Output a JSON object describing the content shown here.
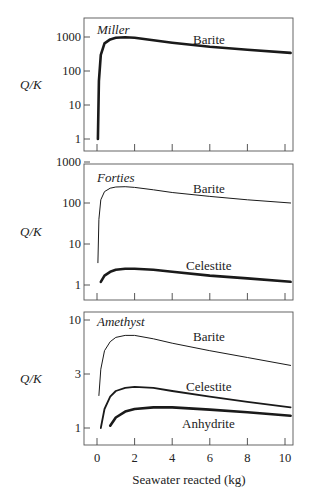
{
  "chart_data": [
    {
      "type": "line",
      "panel_title": "Miller",
      "ylabel": "Q/K",
      "yscale": "log",
      "yticks": [
        1,
        10,
        100,
        1000
      ],
      "ylim": [
        0.8,
        2000
      ],
      "xlim": [
        -0.3,
        10.5
      ],
      "xticks": [
        0,
        2,
        4,
        6,
        8,
        10
      ],
      "series": [
        {
          "name": "Barite",
          "weight": "bold",
          "x": [
            0.05,
            0.1,
            0.2,
            0.4,
            0.7,
            1.0,
            1.5,
            2,
            3,
            4,
            6,
            8,
            10.3
          ],
          "y": [
            1,
            50,
            300,
            650,
            850,
            950,
            980,
            950,
            800,
            680,
            520,
            420,
            340
          ]
        }
      ]
    },
    {
      "type": "line",
      "panel_title": "Forties",
      "ylabel": "Q/K",
      "yscale": "log",
      "yticks": [
        1,
        10,
        100,
        1000
      ],
      "ylim": [
        0.6,
        1000
      ],
      "xlim": [
        -0.3,
        10.5
      ],
      "xticks": [
        0,
        2,
        4,
        6,
        8,
        10
      ],
      "series": [
        {
          "name": "Barite",
          "weight": "thin",
          "x": [
            0.05,
            0.1,
            0.2,
            0.4,
            0.7,
            1.0,
            1.5,
            2,
            3,
            4,
            6,
            8,
            10.3
          ],
          "y": [
            3.5,
            40,
            120,
            190,
            230,
            245,
            250,
            240,
            210,
            180,
            145,
            120,
            100
          ]
        },
        {
          "name": "Celestite",
          "weight": "bold",
          "x": [
            0.2,
            0.4,
            0.7,
            1.0,
            1.5,
            2,
            3,
            4,
            6,
            8,
            10.3
          ],
          "y": [
            1.2,
            1.7,
            2.1,
            2.35,
            2.5,
            2.5,
            2.35,
            2.1,
            1.7,
            1.45,
            1.2
          ]
        }
      ]
    },
    {
      "type": "line",
      "panel_title": "Amethyst",
      "ylabel": "Q/K",
      "yscale": "log",
      "yticks": [
        1,
        3,
        10
      ],
      "ylim": [
        0.8,
        11
      ],
      "xlim": [
        -0.3,
        10.5
      ],
      "xticks": [
        0,
        2,
        4,
        6,
        8,
        10
      ],
      "xlabel": "Seawater reacted (kg)",
      "series": [
        {
          "name": "Barite",
          "weight": "thin",
          "x": [
            0.1,
            0.2,
            0.4,
            0.7,
            1.0,
            1.5,
            2,
            3,
            4,
            6,
            8,
            10.3
          ],
          "y": [
            2.0,
            3.5,
            5.2,
            6.3,
            6.9,
            7.2,
            7.2,
            6.7,
            6.1,
            5.2,
            4.5,
            3.8
          ]
        },
        {
          "name": "Celestite",
          "weight": "medium",
          "x": [
            0.2,
            0.4,
            0.7,
            1.0,
            1.5,
            2,
            3,
            4,
            6,
            8,
            10.3
          ],
          "y": [
            1.0,
            1.5,
            1.95,
            2.2,
            2.35,
            2.4,
            2.35,
            2.2,
            1.95,
            1.75,
            1.55
          ]
        },
        {
          "name": "Anhydrite",
          "weight": "bold",
          "x": [
            0.7,
            1.0,
            1.5,
            2,
            3,
            4,
            6,
            8,
            10.3
          ],
          "y": [
            1.05,
            1.25,
            1.42,
            1.5,
            1.55,
            1.55,
            1.48,
            1.4,
            1.3
          ]
        }
      ]
    }
  ],
  "labels": {
    "ylabel": "Q/K",
    "xlabel": "Seawater reacted (kg)",
    "panel1": {
      "title": "Miller",
      "series": [
        "Barite"
      ],
      "yticks": [
        "1000",
        "100",
        "10",
        "1"
      ]
    },
    "panel2": {
      "title": "Forties",
      "series": [
        "Barite",
        "Celestite"
      ],
      "yticks": [
        "1000",
        "100",
        "10",
        "1"
      ]
    },
    "panel3": {
      "title": "Amethyst",
      "series": [
        "Barite",
        "Celestite",
        "Anhydrite"
      ],
      "yticks": [
        "10",
        "3",
        "1"
      ]
    },
    "xticks": [
      "0",
      "2",
      "4",
      "6",
      "8",
      "10"
    ]
  }
}
